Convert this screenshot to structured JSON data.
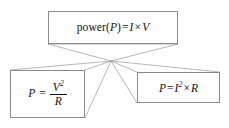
{
  "diagram": {
    "background_color": "#ffffff",
    "border_color": "#8a8a8a",
    "line_color": "#9a9a9a",
    "text_color": "#111111",
    "convergence_point": {
      "x": 111,
      "y": 61
    },
    "nodes": [
      {
        "id": "power",
        "full_text": "power (P) = I × V",
        "label_word": "power",
        "open_paren": "(",
        "symbol": "P",
        "close_paren": ")",
        "equals": "=",
        "left_var": "I",
        "times": "×",
        "right_var": "V"
      },
      {
        "id": "v-squared-over-r",
        "full_text": "P = V² / R",
        "symbol": "P",
        "equals": "=",
        "numerator": "V",
        "numerator_exponent": "2",
        "denominator": "R"
      },
      {
        "id": "i-squared-times-r",
        "full_text": "P = I² × R",
        "symbol": "P",
        "equals": "=",
        "base": "I",
        "exponent": "2",
        "times": "×",
        "factor": "R"
      }
    ]
  }
}
